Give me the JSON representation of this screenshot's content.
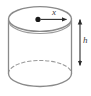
{
  "figure": {
    "type": "geometric-diagram",
    "shape": "cylinder",
    "background_color": "#ffffff",
    "outline_color": "#8a8a8a",
    "fill_color": "#ffffff",
    "dot_color": "#1a1a1a",
    "arrow_color": "#2b2b2b",
    "label_color": "#3a3a3a",
    "labels": {
      "radius": "x",
      "height": "h"
    },
    "parts": {
      "top_ellipse": "top-face-ellipse",
      "bottom_hidden_arc": "bottom-hidden-dashed-arc",
      "bottom_visible_arc": "bottom-visible-arc",
      "left_wall": "left-side-wall",
      "right_wall": "right-side-wall",
      "center_dot": "center-point",
      "radius_arrow": "radius-arrow",
      "height_arrow": "height-dimension-arrow"
    }
  }
}
